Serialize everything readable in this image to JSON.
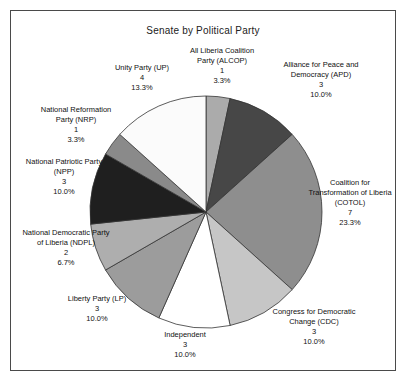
{
  "window": {
    "title": "Senate by Political Party"
  },
  "chart_data": {
    "type": "pie",
    "title": "Senate by Political Party",
    "total_seats": 30,
    "start_angle": "12 o'clock",
    "direction": "clockwise",
    "grid": false,
    "legend": "none (labels around slices)",
    "outline_color": "#333333",
    "slices": [
      {
        "label": "All Liberia Coalition\nParty (ALCOP)",
        "seats": 1,
        "pct": "3.3%",
        "color": "#ababab"
      },
      {
        "label": "Alliance for Peace and\nDemocracy (APD)",
        "seats": 3,
        "pct": "10.0%",
        "color": "#474747"
      },
      {
        "label": "Coalition for\nTransformation of Liberia\n(COTOL)",
        "seats": 7,
        "pct": "23.3%",
        "color": "#8e8e8e"
      },
      {
        "label": "Congress for Democratic\nChange (CDC)",
        "seats": 3,
        "pct": "10.0%",
        "color": "#c6c6c6"
      },
      {
        "label": "Independent",
        "seats": 3,
        "pct": "10.0%",
        "color": "#ffffff"
      },
      {
        "label": "Liberty Party (LP)",
        "seats": 3,
        "pct": "10.0%",
        "color": "#9c9c9c"
      },
      {
        "label": "National Democratic Party\nof Liberia (NDPL)",
        "seats": 2,
        "pct": "6.7%",
        "color": "#aeaeae"
      },
      {
        "label": "National Patriotic Party\n(NPP)",
        "seats": 3,
        "pct": "10.0%",
        "color": "#1f1f1f"
      },
      {
        "label": "National Reformation\nParty (NRP)",
        "seats": 1,
        "pct": "3.3%",
        "color": "#8a8a8a"
      },
      {
        "label": "Unity Party (UP)",
        "seats": 4,
        "pct": "13.3%",
        "color": "#fbfbfb"
      }
    ]
  }
}
